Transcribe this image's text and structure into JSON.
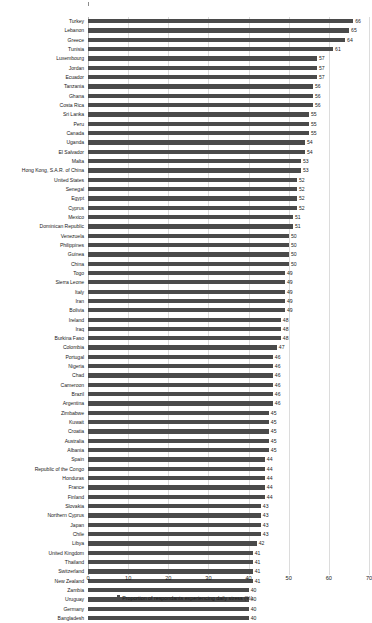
{
  "chart_data": {
    "type": "bar",
    "orientation": "horizontal",
    "title": "",
    "subtitle": "",
    "xlabel": "",
    "ylabel": "",
    "xlim": [
      0,
      70
    ],
    "xticks": [
      "0",
      "10",
      "20",
      "30",
      "40",
      "50",
      "60",
      "70"
    ],
    "grid": true,
    "legend_position": "bottom",
    "legend": [
      "Proportion of respondants experiencing daily stress (%)"
    ],
    "series_name": "Proportion of respondants experiencing daily stress (%)",
    "bar_color": "#4a4a4a",
    "categories": [
      "Turkey",
      "Lebanon",
      "Greece",
      "Tunisia",
      "Luxembourg",
      "Jordan",
      "Ecuador",
      "Tanzania",
      "Ghana",
      "Costa Rica",
      "Sri Lanka",
      "Peru",
      "Canada",
      "Uganda",
      "El Salvador",
      "Malta",
      "Hong Kong, S.A.R. of China",
      "United States",
      "Senegal",
      "Egypt",
      "Cyprus",
      "Mexico",
      "Dominican Republic",
      "Venezuela",
      "Philippines",
      "Guinea",
      "China",
      "Togo",
      "Sierra Leone",
      "Italy",
      "Iran",
      "Bolivia",
      "Ireland",
      "Iraq",
      "Burkina Faso",
      "Colombia",
      "Portugal",
      "Nigeria",
      "Chad",
      "Cameroon",
      "Brazil",
      "Argentina",
      "Zimbabwe",
      "Kuwait",
      "Croatia",
      "Australia",
      "Albania",
      "Spain",
      "Republic of the Congo",
      "Honduras",
      "France",
      "Finland",
      "Slovakia",
      "Northern Cyprus",
      "Japan",
      "Chile",
      "Libya",
      "United Kingdom",
      "Thailand",
      "Switzerland",
      "New Zealand",
      "Zambia",
      "Uruguay",
      "Germany",
      "Bangladesh"
    ],
    "values": [
      66,
      65,
      64,
      61,
      57,
      57,
      57,
      56,
      56,
      56,
      55,
      55,
      55,
      54,
      54,
      53,
      53,
      52,
      52,
      52,
      52,
      51,
      51,
      50,
      50,
      50,
      50,
      49,
      49,
      49,
      49,
      49,
      48,
      48,
      48,
      47,
      46,
      46,
      46,
      46,
      46,
      46,
      45,
      45,
      45,
      45,
      45,
      44,
      44,
      44,
      44,
      44,
      43,
      43,
      43,
      43,
      42,
      41,
      41,
      41,
      41,
      40,
      40,
      40,
      40
    ]
  }
}
